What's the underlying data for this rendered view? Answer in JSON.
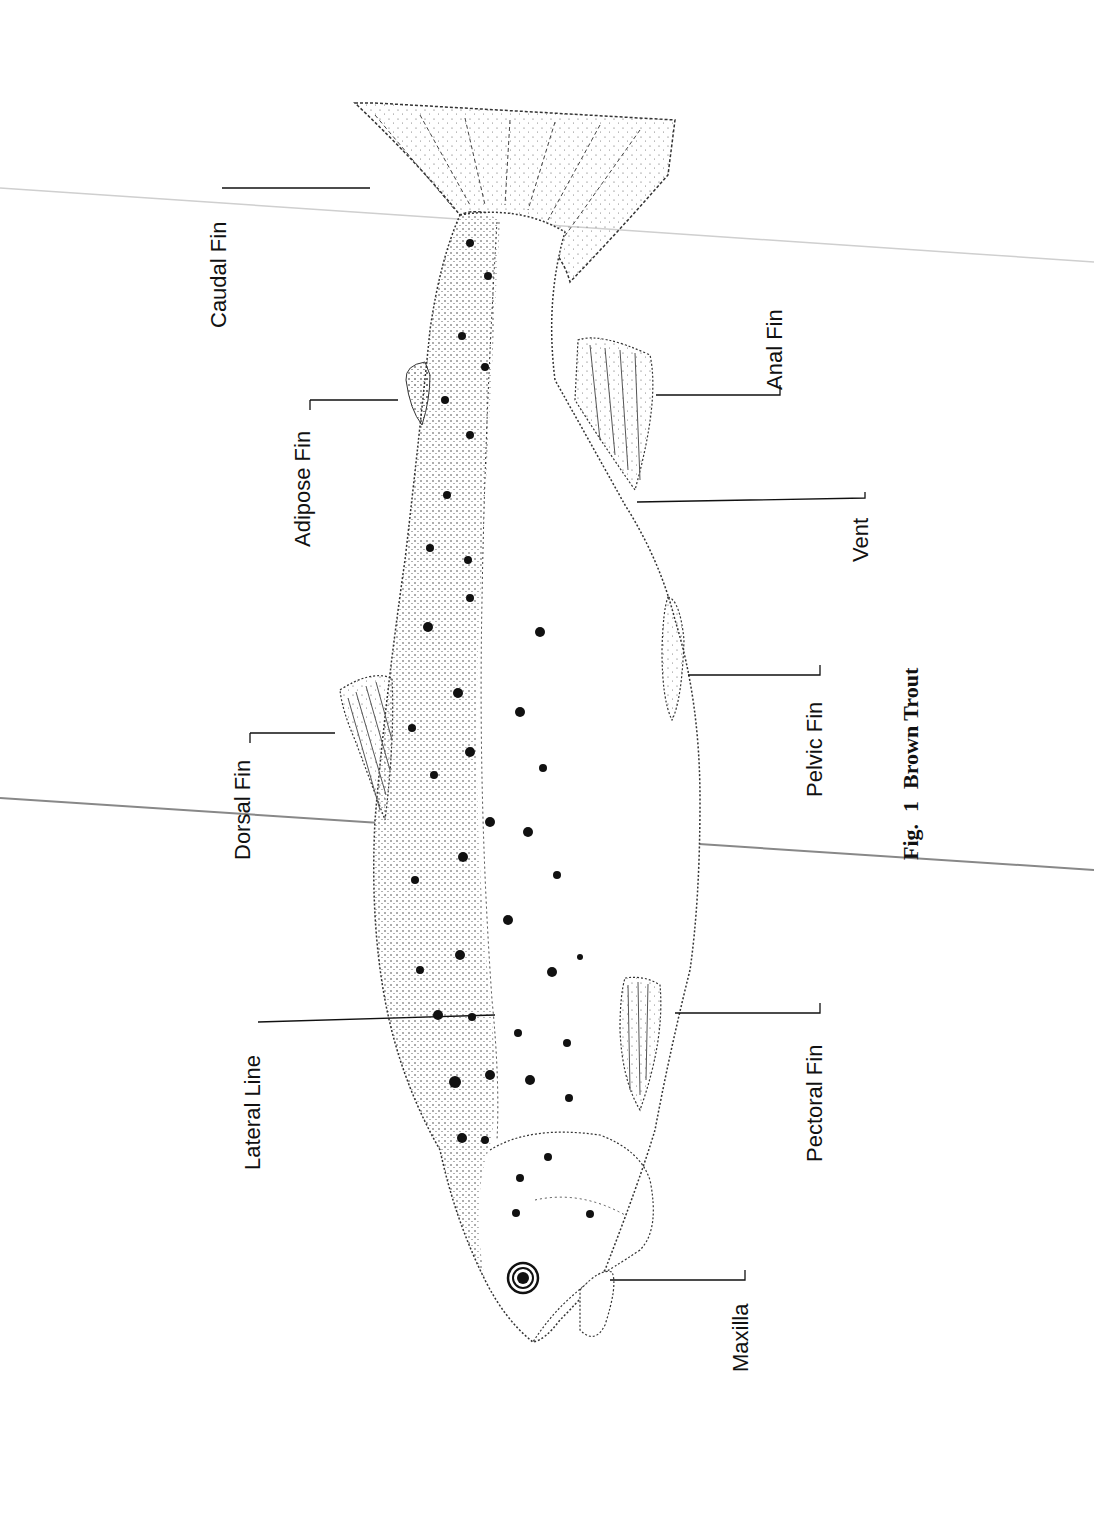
{
  "figure": {
    "caption_prefix": "Fig.",
    "caption_number": "1",
    "caption_title": "Brown Trout",
    "orientation": "rotated 90° counter-clockwise, head at bottom, tail at top"
  },
  "labels": {
    "caudal_fin": "Caudal Fin",
    "adipose_fin": "Adipose Fin",
    "dorsal_fin": "Dorsal Fin",
    "lateral_line": "Lateral Line",
    "anal_fin": "Anal Fin",
    "vent": "Vent",
    "pelvic_fin": "Pelvic Fin",
    "pectoral_fin": "Pectoral Fin",
    "maxilla": "Maxilla"
  },
  "colors": {
    "ink": "#111111",
    "paper": "#ffffff",
    "scan_line": "#888888"
  }
}
